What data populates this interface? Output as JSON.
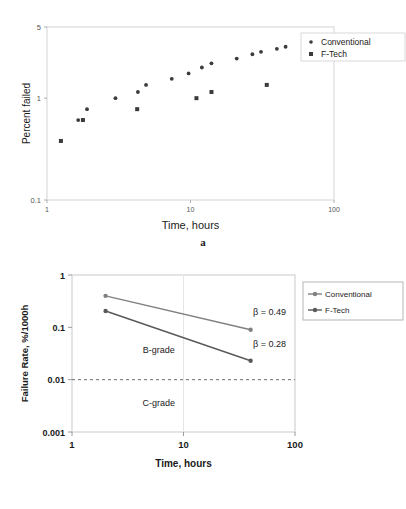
{
  "figures": [
    {
      "id": "a",
      "caption": "a",
      "chart_data": {
        "type": "scatter",
        "title": "",
        "xlabel": "Time, hours",
        "ylabel": "Percent failed",
        "xscale": "log",
        "yscale": "log",
        "xlim": [
          1,
          100
        ],
        "ylim": [
          0.1,
          5
        ],
        "xticks": [
          "1",
          "10",
          "100"
        ],
        "yticks": [
          "0.1",
          "1",
          "5"
        ],
        "grid": false,
        "legend_position": "top-right",
        "series": [
          {
            "name": "Conventional",
            "marker": "circle",
            "color": "#3b3b3b",
            "points": [
              [
                1.65,
                0.61
              ],
              [
                1.9,
                0.78
              ],
              [
                3.0,
                1.0
              ],
              [
                4.3,
                1.15
              ],
              [
                4.9,
                1.35
              ],
              [
                7.4,
                1.55
              ],
              [
                9.7,
                1.75
              ],
              [
                12.0,
                2.0
              ],
              [
                14.0,
                2.2
              ],
              [
                21.0,
                2.45
              ],
              [
                27.0,
                2.7
              ],
              [
                31.0,
                2.85
              ],
              [
                40.0,
                3.05
              ],
              [
                46.0,
                3.2
              ]
            ]
          },
          {
            "name": "F-Tech",
            "marker": "square",
            "color": "#3b3b3b",
            "points": [
              [
                1.25,
                0.38
              ],
              [
                1.78,
                0.61
              ],
              [
                4.25,
                0.78
              ],
              [
                11.0,
                1.0
              ],
              [
                14.0,
                1.15
              ],
              [
                34.0,
                1.35
              ]
            ]
          }
        ]
      }
    },
    {
      "id": "b",
      "caption": "b",
      "chart_data": {
        "type": "line",
        "title": "",
        "xlabel": "Time, hours",
        "ylabel": "Failure Rate, %/1000h",
        "xscale": "log",
        "yscale": "log",
        "xlim": [
          1,
          100
        ],
        "ylim": [
          0.001,
          1
        ],
        "xticks": [
          "1",
          "10",
          "100"
        ],
        "yticks": [
          "0.001",
          "0.01",
          "0.1",
          "1"
        ],
        "grid": false,
        "legend_position": "right",
        "series": [
          {
            "name": "Conventional",
            "marker": "circle",
            "color": "#808080",
            "points": [
              [
                2.0,
                0.4
              ],
              [
                40.0,
                0.09
              ]
            ],
            "annotation": "β = 0.49"
          },
          {
            "name": "F-Tech",
            "marker": "circle",
            "color": "#595959",
            "points": [
              [
                2.0,
                0.205
              ],
              [
                40.0,
                0.023
              ]
            ],
            "annotation": "β = 0.28"
          }
        ],
        "threshold_line": {
          "value": 0.01,
          "style": "dashed",
          "color": "#6e6e6e"
        },
        "annotations": [
          {
            "text": "B-grade",
            "x": 6.0,
            "y": 0.033
          },
          {
            "text": "C-grade",
            "x": 6.0,
            "y": 0.0032
          },
          {
            "text": "β = 0.49",
            "x": 42.0,
            "y": 0.175
          },
          {
            "text": "β = 0.28",
            "x": 42.0,
            "y": 0.042
          }
        ]
      }
    }
  ]
}
